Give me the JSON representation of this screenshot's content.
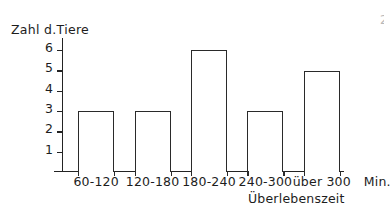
{
  "chart_data": {
    "type": "bar",
    "title": "",
    "categories": [
      "60-120",
      "120-180",
      "180-240",
      "240-300",
      "über 300"
    ],
    "values": [
      3,
      3,
      6,
      3,
      5
    ],
    "xlabel": "Überlebenszeit",
    "ylabel": "Zahl d.Tiere",
    "xunit": "Min.",
    "ylim": [
      0,
      6.6
    ],
    "yticks": [
      1,
      2,
      3,
      4,
      5,
      6
    ],
    "ytick_labels": [
      "1",
      "2",
      "3",
      "4",
      "5",
      "6"
    ],
    "grid": false,
    "legend": false,
    "bar_fill": "#ffffff",
    "bar_outline": "#2a2a2a",
    "background": "#ffffff"
  },
  "figure": {
    "y_axis_title": "Zahl d.Tiere",
    "x_axis_title": "Überlebenszeit",
    "x_unit_label": "Min.",
    "artifact": "2"
  }
}
